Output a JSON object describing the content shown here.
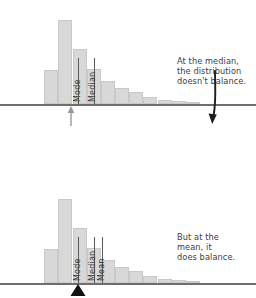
{
  "chart_data": [
    {
      "type": "bar",
      "id": "median-panel",
      "title": "",
      "xlabel": "",
      "ylabel": "",
      "grid": false,
      "legend": null,
      "annotation": "At the median,\nthe distribution\ndoesn't balance.",
      "categories": [
        "1",
        "2",
        "3",
        "4",
        "5",
        "6",
        "7",
        "8",
        "9",
        "10",
        "11",
        "12"
      ],
      "values": [
        0,
        32,
        80,
        52,
        33,
        22,
        15,
        11,
        7,
        4,
        2.5,
        1.5
      ],
      "ylim": [
        0,
        95
      ],
      "markers": [
        {
          "label": "Mode",
          "category_index": 2,
          "x_frac": 0.285
        },
        {
          "label": "Median",
          "category_index": 3,
          "x_frac": 0.375
        }
      ],
      "arrows": [
        {
          "name": "median-up-arrow",
          "direction": "up",
          "x_frac": 0.375
        },
        {
          "name": "imbalance-down-arrow",
          "direction": "down",
          "x_frac": 0.845
        }
      ]
    },
    {
      "type": "bar",
      "id": "mean-panel",
      "title": "",
      "xlabel": "",
      "ylabel": "",
      "grid": false,
      "legend": null,
      "annotation": "But at the\nmean, it\ndoes balance.",
      "categories": [
        "1",
        "2",
        "3",
        "4",
        "5",
        "6",
        "7",
        "8",
        "9",
        "10",
        "11",
        "12"
      ],
      "values": [
        0,
        32,
        80,
        52,
        33,
        22,
        15,
        11,
        7,
        4,
        2.5,
        1.5
      ],
      "ylim": [
        0,
        95
      ],
      "markers": [
        {
          "label": "Mode",
          "category_index": 2,
          "x_frac": 0.285
        },
        {
          "label": "Median",
          "category_index": 3,
          "x_frac": 0.375
        },
        {
          "label": "Mean",
          "category_index": 3,
          "x_frac": 0.425
        }
      ],
      "fulcrum": {
        "name": "balance-fulcrum",
        "x_frac": 0.425
      }
    }
  ],
  "panels": {
    "top": {
      "annotation": "At the median,\nthe distribution\ndoesn't balance.",
      "labels": {
        "mode": "Mode",
        "median": "Median"
      }
    },
    "bottom": {
      "annotation": "But at the\nmean, it\ndoes balance.",
      "labels": {
        "mode": "Mode",
        "median": "Median",
        "mean": "Mean"
      }
    }
  },
  "colors": {
    "bar_fill": "#d8d8d8",
    "bar_stroke": "#c9c9c9",
    "baseline": "#6e6e6e",
    "text": "#3d3d3d",
    "tick": "#5a5a5a",
    "fulcrum": "#111111",
    "background": "#ffffff"
  }
}
